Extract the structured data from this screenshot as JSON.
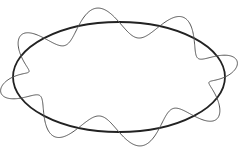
{
  "diagram": {
    "ellipse": {
      "cx": 119,
      "cy": 77,
      "rx": 106,
      "ry": 55,
      "stroke": "#222222",
      "stroke_width": 1.8
    },
    "wave": {
      "wavelengths": 8,
      "amplitude": 15,
      "stroke": "#555555",
      "stroke_width": 1.0,
      "phase_deg": 90
    }
  }
}
